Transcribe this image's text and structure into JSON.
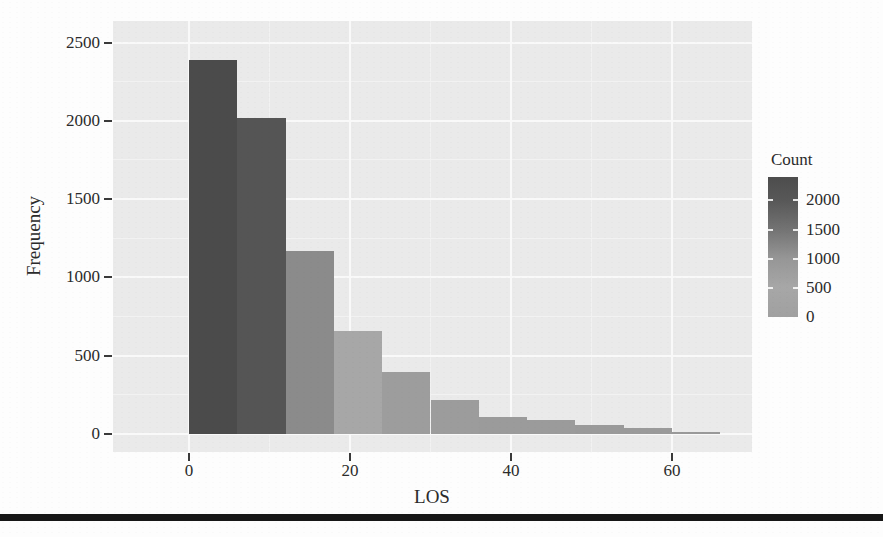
{
  "page": {
    "background": "#fdfdfd",
    "divider_color": "#161616"
  },
  "chart_data": {
    "type": "bar",
    "subtype": "histogram",
    "title": "",
    "xlabel": "LOS",
    "ylabel": "Frequency",
    "x_ticks": [
      0,
      20,
      40,
      60
    ],
    "x_minor_ticks": [
      10,
      30,
      50
    ],
    "y_ticks": [
      0,
      500,
      1000,
      1500,
      2000,
      2500
    ],
    "y_minor_ticks": [
      250,
      750,
      1250,
      1750,
      2250
    ],
    "xlim": [
      -9,
      70
    ],
    "ylim": [
      0,
      2640
    ],
    "grid": "on",
    "legend_position": "right",
    "panel_bg": "#eaeaea",
    "grid_major_color": "#f9f9f9",
    "grid_minor_color": "#f2f2f2",
    "text_color": "#2b2b2b",
    "bin_width": 6,
    "bins": [
      {
        "x0": 0,
        "x1": 6,
        "count": 2390,
        "fill": "#4b4b4b"
      },
      {
        "x0": 6,
        "x1": 12,
        "count": 2020,
        "fill": "#555555"
      },
      {
        "x0": 12,
        "x1": 18,
        "count": 1170,
        "fill": "#8b8b8b"
      },
      {
        "x0": 18,
        "x1": 24,
        "count": 655,
        "fill": "#a7a7a7"
      },
      {
        "x0": 24,
        "x1": 30,
        "count": 395,
        "fill": "#9d9d9d"
      },
      {
        "x0": 30,
        "x1": 36,
        "count": 215,
        "fill": "#9c9c9c"
      },
      {
        "x0": 36,
        "x1": 42,
        "count": 110,
        "fill": "#9b9b9b"
      },
      {
        "x0": 42,
        "x1": 48,
        "count": 90,
        "fill": "#9b9b9b"
      },
      {
        "x0": 48,
        "x1": 54,
        "count": 60,
        "fill": "#9a9a9a"
      },
      {
        "x0": 54,
        "x1": 60,
        "count": 40,
        "fill": "#9a9a9a"
      },
      {
        "x0": 60,
        "x1": 66,
        "count": 15,
        "fill": "#999999"
      }
    ],
    "legend": {
      "title": "Count",
      "ticks": [
        2000,
        1500,
        1000,
        500,
        0
      ],
      "dash_ticks": [
        2000,
        1500,
        1000,
        500
      ],
      "max": 2400,
      "gradient": [
        {
          "pos": 0,
          "color": "#4d4d4d"
        },
        {
          "pos": 17,
          "color": "#585858"
        },
        {
          "pos": 38,
          "color": "#747474"
        },
        {
          "pos": 58,
          "color": "#969696"
        },
        {
          "pos": 79,
          "color": "#a7a7a7"
        },
        {
          "pos": 100,
          "color": "#a0a0a0"
        }
      ]
    }
  }
}
